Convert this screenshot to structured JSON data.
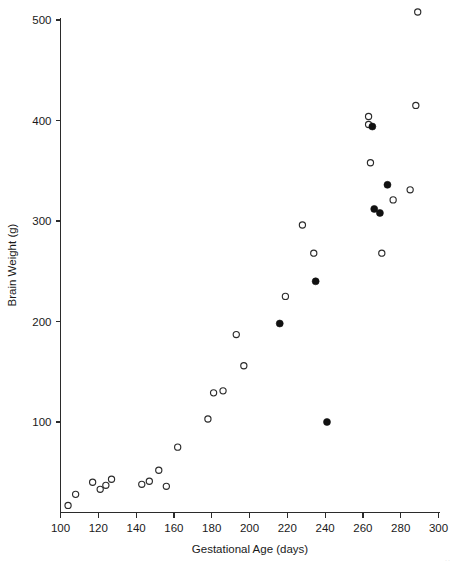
{
  "chart_data": {
    "type": "scatter",
    "title": "",
    "xlabel": "Gestational Age (days)",
    "ylabel": "Brain Weight (g)",
    "xlim": [
      100,
      300
    ],
    "ylim": [
      10,
      510
    ],
    "xticks": [
      100,
      120,
      140,
      160,
      180,
      200,
      220,
      240,
      260,
      280,
      300
    ],
    "yticks": [
      100,
      200,
      300,
      400,
      500
    ],
    "grid": false,
    "legend": null,
    "series": [
      {
        "name": "open-circle",
        "marker": "open circle",
        "color": "#2b2b2b",
        "points": [
          {
            "x": 104,
            "y": 17
          },
          {
            "x": 108,
            "y": 28
          },
          {
            "x": 117,
            "y": 40
          },
          {
            "x": 121,
            "y": 33
          },
          {
            "x": 124,
            "y": 37
          },
          {
            "x": 127,
            "y": 43
          },
          {
            "x": 143,
            "y": 38
          },
          {
            "x": 147,
            "y": 41
          },
          {
            "x": 152,
            "y": 52
          },
          {
            "x": 156,
            "y": 36
          },
          {
            "x": 162,
            "y": 75
          },
          {
            "x": 178,
            "y": 103
          },
          {
            "x": 181,
            "y": 129
          },
          {
            "x": 186,
            "y": 131
          },
          {
            "x": 193,
            "y": 187
          },
          {
            "x": 197,
            "y": 156
          },
          {
            "x": 219,
            "y": 225
          },
          {
            "x": 228,
            "y": 296
          },
          {
            "x": 234,
            "y": 268
          },
          {
            "x": 263,
            "y": 404
          },
          {
            "x": 263,
            "y": 396
          },
          {
            "x": 264,
            "y": 358
          },
          {
            "x": 270,
            "y": 268
          },
          {
            "x": 276,
            "y": 321
          },
          {
            "x": 285,
            "y": 331
          },
          {
            "x": 288,
            "y": 415
          },
          {
            "x": 289,
            "y": 508
          }
        ]
      },
      {
        "name": "filled-circle",
        "marker": "filled circle",
        "color": "#111111",
        "points": [
          {
            "x": 216,
            "y": 198
          },
          {
            "x": 235,
            "y": 240
          },
          {
            "x": 241,
            "y": 100
          },
          {
            "x": 265,
            "y": 394
          },
          {
            "x": 266,
            "y": 312
          },
          {
            "x": 269,
            "y": 308
          },
          {
            "x": 273,
            "y": 336
          }
        ]
      }
    ]
  },
  "axes": {
    "x_title": "Gestational Age (days)",
    "y_title": "Brain Weight (g)",
    "x_tick_labels": [
      "100",
      "120",
      "140",
      "160",
      "180",
      "200",
      "220",
      "240",
      "260",
      "280",
      "300"
    ],
    "y_tick_labels": [
      "100",
      "200",
      "300",
      "400",
      "500"
    ]
  },
  "colors": {
    "axis": "#2b2b2b",
    "open_marker_stroke": "#2b2b2b",
    "filled_marker": "#111111",
    "background": "#ffffff"
  }
}
